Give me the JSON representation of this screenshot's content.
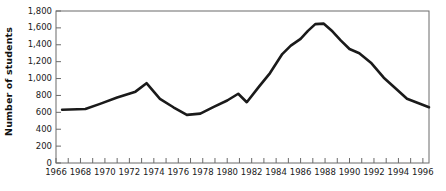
{
  "chart_data": {
    "type": "line",
    "title": "",
    "xlabel": "",
    "ylabel": "Number of students",
    "xlim": [
      1966,
      1996.5
    ],
    "ylim": [
      0,
      1800
    ],
    "grid": false,
    "legend": "none",
    "line_color": "#1a1a1a",
    "x_tick_labels": [
      "1966",
      "1968",
      "1970",
      "1972",
      "1974",
      "1976",
      "1978",
      "1980",
      "1982",
      "1984",
      "1986",
      "1988",
      "1990",
      "1992",
      "1994",
      "1996"
    ],
    "x_tick_values": [
      1966,
      1968,
      1970,
      1972,
      1974,
      1976,
      1978,
      1980,
      1982,
      1984,
      1986,
      1988,
      1990,
      1992,
      1994,
      1996
    ],
    "x_minor_ticks": [
      1966,
      1967,
      1968,
      1969,
      1970,
      1971,
      1972,
      1973,
      1974,
      1975,
      1976,
      1977,
      1978,
      1979,
      1980,
      1981,
      1982,
      1983,
      1984,
      1985,
      1986,
      1987,
      1988,
      1989,
      1990,
      1991,
      1992,
      1993,
      1994,
      1995,
      1996
    ],
    "y_tick_labels": [
      "0",
      "200",
      "400",
      "600",
      "800",
      "1,000",
      "1,200",
      "1,400",
      "1,600",
      "1,800"
    ],
    "y_tick_values": [
      0,
      200,
      400,
      600,
      800,
      1000,
      1200,
      1400,
      1600,
      1800
    ],
    "x": [
      1966.5,
      1967.5,
      1968.5,
      1969.5,
      1970.5,
      1971.5,
      1972.5,
      1973.5,
      1974.5,
      1975.5,
      1976.5,
      1977.5,
      1978.5,
      1979.5,
      1980.5,
      1981.5,
      1982.5,
      1983.5,
      1984.5,
      1985.5,
      1986.5,
      1987.5,
      1988.5,
      1989.5,
      1990.5,
      1991.5,
      1992.5,
      1993.5,
      1994.5,
      1995.5,
      1996.5
    ],
    "values": [
      630,
      635,
      640,
      700,
      740,
      790,
      840,
      945,
      755,
      660,
      575,
      580,
      640,
      700,
      740,
      820,
      720,
      880,
      1020,
      1200,
      1390,
      1480,
      1580,
      1645,
      1650,
      1560,
      1410,
      1340,
      1290,
      1190,
      1080
    ],
    "series": [
      {
        "name": "Number of students",
        "points": [
          {
            "year": 1966.5,
            "value": 630
          },
          {
            "year": 1968.4,
            "value": 640
          },
          {
            "year": 1969.6,
            "value": 700
          },
          {
            "year": 1971.0,
            "value": 775
          },
          {
            "year": 1972.5,
            "value": 845
          },
          {
            "year": 1973.4,
            "value": 945
          },
          {
            "year": 1974.5,
            "value": 760
          },
          {
            "year": 1975.6,
            "value": 660
          },
          {
            "year": 1976.7,
            "value": 570
          },
          {
            "year": 1977.8,
            "value": 585
          },
          {
            "year": 1978.9,
            "value": 665
          },
          {
            "year": 1980.0,
            "value": 740
          },
          {
            "year": 1980.9,
            "value": 820
          },
          {
            "year": 1981.6,
            "value": 720
          },
          {
            "year": 1982.6,
            "value": 905
          },
          {
            "year": 1983.5,
            "value": 1065
          },
          {
            "year": 1984.5,
            "value": 1290
          },
          {
            "year": 1985.2,
            "value": 1390
          },
          {
            "year": 1986.0,
            "value": 1470
          },
          {
            "year": 1986.6,
            "value": 1565
          },
          {
            "year": 1987.2,
            "value": 1645
          },
          {
            "year": 1987.9,
            "value": 1650
          },
          {
            "year": 1988.6,
            "value": 1560
          },
          {
            "year": 1989.3,
            "value": 1450
          },
          {
            "year": 1990.0,
            "value": 1350
          },
          {
            "year": 1990.8,
            "value": 1300
          },
          {
            "year": 1991.8,
            "value": 1180
          },
          {
            "year": 1992.8,
            "value": 1010
          },
          {
            "year": 1993.8,
            "value": 880
          },
          {
            "year": 1994.7,
            "value": 760
          },
          {
            "year": 1995.6,
            "value": 710
          },
          {
            "year": 1996.5,
            "value": 660
          }
        ]
      }
    ]
  },
  "axis": {
    "y_title": "Number of students"
  }
}
